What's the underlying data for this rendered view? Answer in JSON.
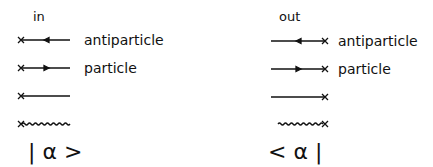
{
  "in_column": {
    "header": "in",
    "rows": [
      {
        "label": "antiparticle",
        "line": "fermion-antiparticle"
      },
      {
        "label": "particle",
        "line": "fermion-particle"
      },
      {
        "label": "",
        "line": "scalar"
      },
      {
        "label": "",
        "line": "photon-wavy"
      }
    ],
    "state": "| α >"
  },
  "out_column": {
    "header": "out",
    "rows": [
      {
        "label": "antiparticle",
        "line": "fermion-antiparticle"
      },
      {
        "label": "particle",
        "line": "fermion-particle"
      },
      {
        "label": "",
        "line": "scalar"
      },
      {
        "label": "",
        "line": "photon-wavy"
      }
    ],
    "state": "< α |"
  },
  "colors": {
    "ink": "#111111",
    "background": "#ffffff"
  }
}
